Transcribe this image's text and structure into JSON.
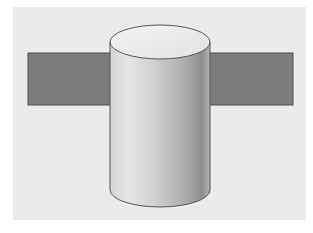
{
  "figure": {
    "colors": {
      "page": "#ffffff",
      "panel": "#ebebeb",
      "bar_fill": "#7c7c7c",
      "bar_stroke": "#4f4f4f",
      "cylinder_stroke": "#555555",
      "cylinder_top": "#f1f1f1",
      "cylinder_light": "#e4e4e4",
      "cylinder_dark": "#8a8a8a"
    },
    "shapes": [
      {
        "name": "bar",
        "type": "rectangle"
      },
      {
        "name": "cylinder",
        "type": "cylinder"
      }
    ]
  }
}
